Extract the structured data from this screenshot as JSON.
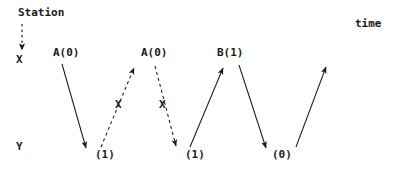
{
  "diagram": {
    "type": "message-sequence-chart",
    "title_labels": {
      "station": "Station",
      "time": "time"
    },
    "stations": [
      {
        "id": "X",
        "label": "X",
        "y": 62
      },
      {
        "id": "Y",
        "label": "Y",
        "y": 147
      }
    ],
    "messages": [
      {
        "id": "m1",
        "label": "A(0)",
        "style": "solid",
        "from": "X",
        "to": "Y",
        "status": "delivered",
        "x1": 62,
        "y1": 64,
        "x2": 86,
        "y2": 148
      },
      {
        "id": "m2",
        "label": "A(0)",
        "style": "dashed",
        "from": "Y",
        "to": "X",
        "status": "lost",
        "marker": "X",
        "marker_x": 119,
        "marker_y": 105,
        "x1": 101,
        "y1": 147,
        "x2": 134,
        "y2": 68
      },
      {
        "id": "m3",
        "label": "",
        "style": "dashed",
        "from": "X",
        "to": "Y",
        "status": "lost",
        "marker": "X",
        "marker_x": 163,
        "marker_y": 105,
        "x1": 155,
        "y1": 66,
        "x2": 176,
        "y2": 146
      },
      {
        "id": "m4",
        "label": "B(1)",
        "style": "solid",
        "from": "Y",
        "to": "X",
        "status": "delivered",
        "x1": 190,
        "y1": 147,
        "x2": 223,
        "y2": 68
      },
      {
        "id": "m5",
        "label": "",
        "style": "solid",
        "from": "X",
        "to": "Y",
        "status": "delivered",
        "x1": 239,
        "y1": 65,
        "x2": 266,
        "y2": 148
      },
      {
        "id": "m6",
        "label": "",
        "style": "solid",
        "from": "Y",
        "to": "X",
        "status": "delivered",
        "x1": 296,
        "y1": 147,
        "x2": 326,
        "y2": 67
      }
    ],
    "message_labels": {
      "a_first": "A(0)",
      "a_second": "A(0)",
      "b_first": "B(1)"
    },
    "value_labels": {
      "v1": "(1)",
      "v2": "(1)",
      "v3": "(0)"
    },
    "markers": {
      "lost_1": "X",
      "lost_2": "X"
    },
    "pointer": {
      "style": "dashed",
      "from_label": "Station",
      "to_station": "X",
      "x": 22,
      "y1": 24,
      "y2": 50
    },
    "colors": {
      "ink": "#1a1a1a",
      "background": "#ffffff"
    }
  }
}
